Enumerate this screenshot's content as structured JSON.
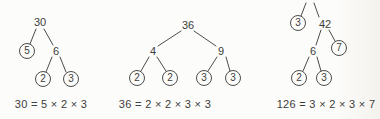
{
  "figure_description": "Three prime factor trees with circled prime factors and factorization equations",
  "ink_color": "#4c4c4c",
  "background_color": "#fcfcfa",
  "trees": [
    {
      "id": "factor-tree-30",
      "nodes": [
        {
          "label": "30",
          "circled": false
        },
        {
          "label": "5",
          "circled": true
        },
        {
          "label": "6",
          "circled": false
        },
        {
          "label": "2",
          "circled": true
        },
        {
          "label": "3",
          "circled": true
        }
      ],
      "equation": "30 = 5 × 2 × 3"
    },
    {
      "id": "factor-tree-36",
      "nodes": [
        {
          "label": "36",
          "circled": false
        },
        {
          "label": "4",
          "circled": false
        },
        {
          "label": "9",
          "circled": false
        },
        {
          "label": "2",
          "circled": true
        },
        {
          "label": "2",
          "circled": true
        },
        {
          "label": "3",
          "circled": true
        },
        {
          "label": "3",
          "circled": true
        }
      ],
      "equation": "36 = 2 × 2 × 3 × 3"
    },
    {
      "id": "factor-tree-126",
      "root_clipped": true,
      "nodes": [
        {
          "label": "126",
          "circled": false
        },
        {
          "label": "3",
          "circled": true
        },
        {
          "label": "42",
          "circled": false
        },
        {
          "label": "6",
          "circled": false
        },
        {
          "label": "7",
          "circled": true
        },
        {
          "label": "2",
          "circled": true
        },
        {
          "label": "3",
          "circled": true
        }
      ],
      "equation": "126 = 3 × 2 × 3 × 7"
    }
  ]
}
